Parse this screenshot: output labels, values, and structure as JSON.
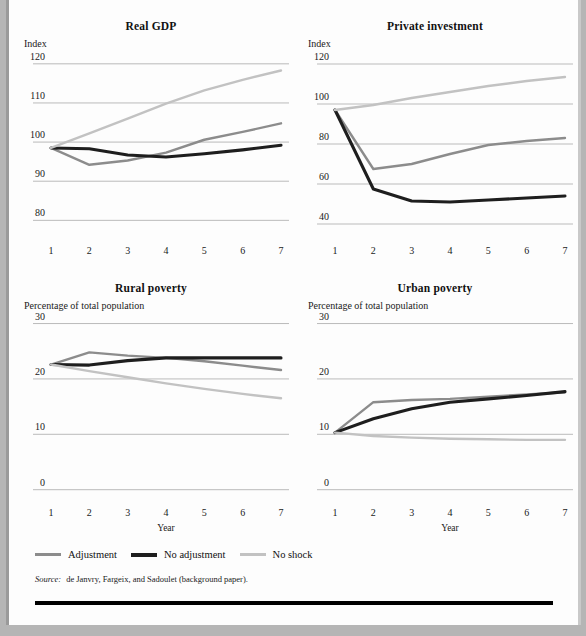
{
  "figure": {
    "top_cut_text": "",
    "source_label": "Source:",
    "source_text": "de Janvry, Fargeix, and Sadoulet (background paper)."
  },
  "legend": {
    "position": "bottom-left",
    "items": [
      {
        "label": "Adjustment",
        "color": "#8c8c8c",
        "weight": "normal"
      },
      {
        "label": "No adjustment",
        "color": "#1e1e1e",
        "weight": "thick"
      },
      {
        "label": "No shock",
        "color": "#c2c2c2",
        "weight": "normal"
      }
    ]
  },
  "colors": {
    "adjustment": "#8c8c8c",
    "no_adjustment": "#1e1e1e",
    "no_shock": "#c2c2c2",
    "gridline": "#a9a9a9",
    "text": "#1a1a1a",
    "rule": "#000000"
  },
  "chart_data": [
    {
      "type": "line",
      "title": "Real GDP",
      "ylabel": "Index",
      "xlabel": "",
      "x": [
        1,
        2,
        3,
        4,
        5,
        6,
        7
      ],
      "xticks": [
        "1",
        "2",
        "3",
        "4",
        "5",
        "6",
        "7"
      ],
      "yticks": [
        80,
        90,
        100,
        110,
        120
      ],
      "ylim": [
        76,
        122
      ],
      "xlim": [
        1,
        7
      ],
      "grid": true,
      "legend": "shared-bottom",
      "series": [
        {
          "name": "Adjustment",
          "color": "#8c8c8c",
          "values": [
            98.5,
            94.2,
            95.3,
            97.3,
            100.6,
            102.6,
            104.8
          ]
        },
        {
          "name": "No adjustment",
          "color": "#1e1e1e",
          "values": [
            98.5,
            98.3,
            96.7,
            96.2,
            97.0,
            98.0,
            99.2
          ]
        },
        {
          "name": "No shock",
          "color": "#c2c2c2",
          "values": [
            98.5,
            102.2,
            106.0,
            109.8,
            113.2,
            115.9,
            118.3
          ]
        }
      ]
    },
    {
      "type": "line",
      "title": "Private investment",
      "ylabel": "Index",
      "xlabel": "",
      "x": [
        1,
        2,
        3,
        4,
        5,
        6,
        7
      ],
      "xticks": [
        "1",
        "2",
        "3",
        "4",
        "5",
        "6",
        "7"
      ],
      "yticks": [
        40,
        60,
        80,
        100,
        120
      ],
      "ylim": [
        34,
        124
      ],
      "xlim": [
        1,
        7
      ],
      "grid": true,
      "legend": "shared-bottom",
      "series": [
        {
          "name": "Adjustment",
          "color": "#8c8c8c",
          "values": [
            97.0,
            67.5,
            70.0,
            75.0,
            79.5,
            81.5,
            83.0
          ]
        },
        {
          "name": "No adjustment",
          "color": "#1e1e1e",
          "values": [
            97.0,
            57.5,
            51.5,
            51.0,
            52.0,
            53.0,
            54.0
          ]
        },
        {
          "name": "No shock",
          "color": "#c2c2c2",
          "values": [
            97.0,
            99.5,
            103.0,
            106.0,
            109.0,
            111.5,
            113.5
          ]
        }
      ]
    },
    {
      "type": "line",
      "title": "Rural poverty",
      "ylabel": "Percentage of total population",
      "xlabel": "Year",
      "x": [
        1,
        2,
        3,
        4,
        5,
        6,
        7
      ],
      "xticks": [
        "1",
        "2",
        "3",
        "4",
        "5",
        "6",
        "7"
      ],
      "yticks": [
        0,
        10,
        20,
        30
      ],
      "ylim": [
        -1.5,
        31
      ],
      "xlim": [
        1,
        7
      ],
      "grid": true,
      "legend": "shared-bottom",
      "series": [
        {
          "name": "Adjustment",
          "color": "#8c8c8c",
          "values": [
            22.6,
            24.8,
            24.2,
            23.8,
            23.2,
            22.4,
            21.6
          ]
        },
        {
          "name": "No adjustment",
          "color": "#1e1e1e",
          "values": [
            22.6,
            22.5,
            23.3,
            23.8,
            23.8,
            23.8,
            23.8
          ]
        },
        {
          "name": "No shock",
          "color": "#c2c2c2",
          "values": [
            22.6,
            21.4,
            20.3,
            19.2,
            18.2,
            17.3,
            16.5
          ]
        }
      ]
    },
    {
      "type": "line",
      "title": "Urban poverty",
      "ylabel": "Percentage of total population",
      "xlabel": "Year",
      "x": [
        1,
        2,
        3,
        4,
        5,
        6,
        7
      ],
      "xticks": [
        "1",
        "2",
        "3",
        "4",
        "5",
        "6",
        "7"
      ],
      "yticks": [
        0,
        10,
        20,
        30
      ],
      "ylim": [
        -1.5,
        31
      ],
      "xlim": [
        1,
        7
      ],
      "grid": true,
      "legend": "shared-bottom",
      "series": [
        {
          "name": "Adjustment",
          "color": "#8c8c8c",
          "values": [
            10.3,
            15.8,
            16.2,
            16.4,
            16.8,
            17.2,
            17.6
          ]
        },
        {
          "name": "No adjustment",
          "color": "#1e1e1e",
          "values": [
            10.3,
            12.8,
            14.6,
            15.8,
            16.4,
            17.0,
            17.7
          ]
        },
        {
          "name": "No shock",
          "color": "#c2c2c2",
          "values": [
            10.3,
            9.7,
            9.4,
            9.2,
            9.1,
            9.0,
            9.0
          ]
        }
      ]
    }
  ]
}
